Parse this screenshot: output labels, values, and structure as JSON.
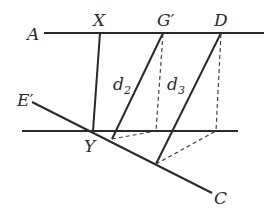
{
  "diagram": {
    "colors": {
      "stroke": "#2a2a2a",
      "dashed": "#444444",
      "background": "#ffffff"
    },
    "labels": {
      "A": "A",
      "X": "X",
      "G": "G′",
      "D": "D",
      "E": "E′",
      "Y": "Y",
      "C": "C",
      "d2_base": "d",
      "d2_sub": "2",
      "d3_base": "d",
      "d3_sub": "3"
    }
  }
}
